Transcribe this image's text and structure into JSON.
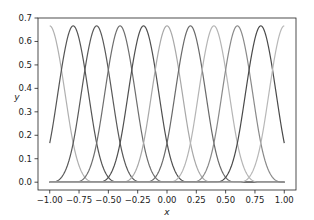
{
  "chart_data": {
    "type": "line",
    "title": "",
    "xlabel": "x",
    "ylabel": "y",
    "xlim": [
      -1.1,
      1.1
    ],
    "ylim": [
      -0.0333,
      0.7
    ],
    "grid": false,
    "legend": null,
    "x_ticks": [
      -1.0,
      -0.75,
      -0.5,
      -0.25,
      0.0,
      0.25,
      0.5,
      0.75,
      1.0
    ],
    "x_tick_labels": [
      "−1.00",
      "−0.75",
      "−0.50",
      "−0.25",
      "0.00",
      "0.25",
      "0.50",
      "0.75",
      "1.00"
    ],
    "y_ticks": [
      0.0,
      0.1,
      0.2,
      0.3,
      0.4,
      0.5,
      0.6,
      0.7
    ],
    "y_tick_labels": [
      "0.0",
      "0.1",
      "0.2",
      "0.3",
      "0.4",
      "0.5",
      "0.6",
      "0.7"
    ],
    "x_domain": [
      -1.0,
      1.0
    ],
    "knot_spacing": 0.2,
    "peak_value": 0.6667,
    "series": [
      {
        "name": "B(-1.0)",
        "center": -1.0,
        "color": "#b0b0b0"
      },
      {
        "name": "B(-0.8)",
        "center": -0.8,
        "color": "#555555"
      },
      {
        "name": "B(-0.6)",
        "center": -0.6,
        "color": "#5a5a5a"
      },
      {
        "name": "B(-0.4)",
        "center": -0.4,
        "color": "#6e6e6e"
      },
      {
        "name": "B(-0.2)",
        "center": -0.2,
        "color": "#505050"
      },
      {
        "name": "B(0.0)",
        "center": 0.0,
        "color": "#a8a8a8"
      },
      {
        "name": "B(0.2)",
        "center": 0.2,
        "color": "#6a6a6a"
      },
      {
        "name": "B(0.4)",
        "center": 0.4,
        "color": "#b5b5b5"
      },
      {
        "name": "B(0.6)",
        "center": 0.6,
        "color": "#8a8a8a"
      },
      {
        "name": "B(0.8)",
        "center": 0.8,
        "color": "#4a4a4a"
      },
      {
        "name": "B(1.0)",
        "center": 1.0,
        "color": "#b8b8b8"
      }
    ]
  }
}
